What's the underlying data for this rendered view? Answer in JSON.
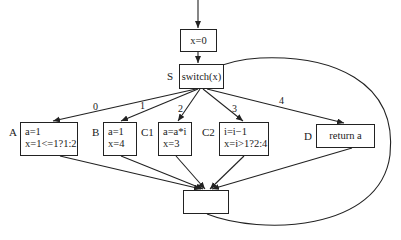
{
  "diagram": {
    "type": "control-flow-graph",
    "nodes": {
      "init": {
        "text": "x=0"
      },
      "switch": {
        "label": "S",
        "text": "switch(x)"
      },
      "A": {
        "label": "A",
        "lines": [
          "a=1",
          "x=1<=1?1:2"
        ]
      },
      "B": {
        "label": "B",
        "lines": [
          "a=1",
          "x=4"
        ]
      },
      "C1": {
        "label": "C1",
        "lines": [
          "a=a*i",
          "x=3"
        ]
      },
      "C2": {
        "label": "C2",
        "lines": [
          "i=i−1",
          "x=i>1?2:4"
        ]
      },
      "D": {
        "label": "D",
        "text": "return a"
      },
      "join": {
        "text": ""
      }
    },
    "edges": [
      {
        "from": "entry",
        "to": "init",
        "label": ""
      },
      {
        "from": "init",
        "to": "switch",
        "label": ""
      },
      {
        "from": "switch",
        "to": "A",
        "label": "0"
      },
      {
        "from": "switch",
        "to": "B",
        "label": "1"
      },
      {
        "from": "switch",
        "to": "C1",
        "label": "2"
      },
      {
        "from": "switch",
        "to": "C2",
        "label": "3"
      },
      {
        "from": "switch",
        "to": "D",
        "label": "4"
      },
      {
        "from": "A",
        "to": "join",
        "label": ""
      },
      {
        "from": "B",
        "to": "join",
        "label": ""
      },
      {
        "from": "C1",
        "to": "join",
        "label": ""
      },
      {
        "from": "C2",
        "to": "join",
        "label": ""
      },
      {
        "from": "D",
        "to": "join",
        "label": ""
      },
      {
        "from": "join",
        "to": "switch",
        "label": ""
      }
    ],
    "edge_labels": {
      "e0": "0",
      "e1": "1",
      "e2": "2",
      "e3": "3",
      "e4": "4"
    }
  }
}
